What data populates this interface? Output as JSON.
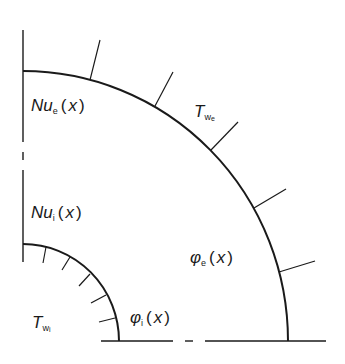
{
  "diagram": {
    "type": "quarter-annulus cross-section",
    "stroke_color": "#1a1a1a",
    "background": "#ffffff",
    "labels": {
      "nu_e": {
        "main": "Nu",
        "sub": "e",
        "open": "(",
        "var": "x",
        "close": ")"
      },
      "nu_i": {
        "main": "Nu",
        "sub": "i",
        "open": "(",
        "var": "x",
        "close": ")"
      },
      "t_we": {
        "main": "T",
        "sub": "w",
        "subsub": "e"
      },
      "t_wi": {
        "main": "T",
        "sub": "w",
        "subsub": "i"
      },
      "phi_e": {
        "main": "φ",
        "sub": "e",
        "open": "(",
        "var": "x",
        "close": ")"
      },
      "phi_i": {
        "main": "φ",
        "sub": "i",
        "open": "(",
        "var": "x",
        "close": ")"
      }
    },
    "outer_wall": {
      "label": "external wall",
      "ticks": 5,
      "tick_direction": "outward"
    },
    "inner_wall": {
      "label": "internal wall",
      "ticks": 5,
      "tick_direction": "inward"
    },
    "symmetry_axes": [
      "vertical",
      "horizontal"
    ]
  }
}
